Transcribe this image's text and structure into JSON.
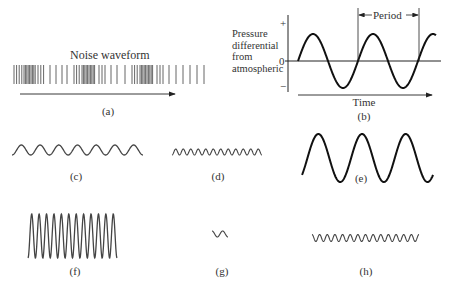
{
  "figure": {
    "panels": [
      {
        "id": "a",
        "caption": "(a)",
        "title": "Noise waveform",
        "kind": "noise"
      },
      {
        "id": "b",
        "caption": "(b)",
        "kind": "labeled-sine",
        "ylabel_lines": [
          "Pressure",
          "differential",
          "from",
          "atmospheric"
        ],
        "y_ticks": {
          "plus": "+",
          "zero": "0",
          "minus": "−"
        },
        "xlabel": "Time",
        "period_label": "Period"
      },
      {
        "id": "c",
        "caption": "(c)",
        "kind": "sine",
        "cycles": 7,
        "amplitude": "low",
        "frequency": "low"
      },
      {
        "id": "d",
        "caption": "(d)",
        "kind": "sine",
        "cycles": 12,
        "amplitude": "low",
        "frequency": "high"
      },
      {
        "id": "e",
        "caption": "(e)",
        "kind": "sine",
        "cycles": 3,
        "amplitude": "high",
        "frequency": "low"
      },
      {
        "id": "f",
        "caption": "(f)",
        "kind": "sine",
        "cycles": 12,
        "amplitude": "high",
        "frequency": "high"
      },
      {
        "id": "g",
        "caption": "(g)",
        "kind": "sine",
        "cycles": 1.5,
        "amplitude": "low",
        "duration": "short"
      },
      {
        "id": "h",
        "caption": "(h)",
        "kind": "sine",
        "cycles": 14,
        "amplitude": "low",
        "frequency": "high"
      }
    ],
    "colors": {
      "stroke": "#222222",
      "noise": "#555555",
      "text": "#333333"
    }
  }
}
